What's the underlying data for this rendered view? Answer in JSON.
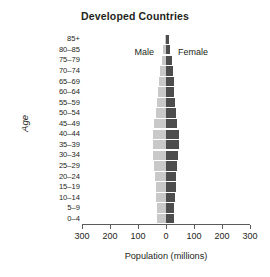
{
  "chart_data": {
    "type": "bar",
    "subtype": "population-pyramid",
    "title": "Developed Countries",
    "xlabel": "Population (millions)",
    "ylabel": "Age",
    "xlim": [
      -300,
      300
    ],
    "xticks": [
      300,
      200,
      100,
      0,
      100,
      200,
      300
    ],
    "xtick_labels": [
      "300",
      "200",
      "100",
      "0",
      "100",
      "200",
      "300"
    ],
    "grid": false,
    "legend_position": "inside-top",
    "categories": [
      "0–4",
      "5–9",
      "10–14",
      "15–19",
      "20–24",
      "25–29",
      "30–34",
      "35–39",
      "40–44",
      "45–49",
      "50–54",
      "55–59",
      "60–64",
      "65–69",
      "70–74",
      "75–79",
      "80–85",
      "85+"
    ],
    "series": [
      {
        "name": "Male",
        "color": "#c9c9c9",
        "direction": "left",
        "values": [
          31,
          32,
          34,
          36,
          38,
          42,
          45,
          48,
          46,
          42,
          37,
          32,
          28,
          24,
          20,
          15,
          9,
          5
        ]
      },
      {
        "name": "Female",
        "color": "#4d4d4d",
        "direction": "right",
        "values": [
          29,
          30,
          32,
          34,
          37,
          40,
          43,
          46,
          45,
          41,
          37,
          33,
          30,
          27,
          24,
          20,
          14,
          9
        ]
      }
    ]
  },
  "labels": {
    "male": "Male",
    "female": "Female"
  },
  "colors": {
    "male_bar": "#c9c9c9",
    "female_bar": "#4d4d4d",
    "axis": "#5b5b5b",
    "text": "#231f20",
    "background": "#ffffff"
  }
}
